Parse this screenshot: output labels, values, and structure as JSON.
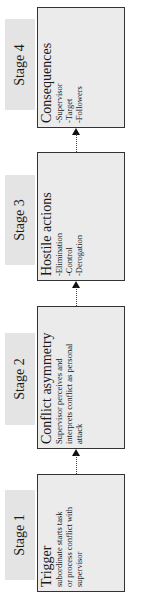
{
  "stages": [
    {
      "label": "Stage 4"
    },
    {
      "label": "Stage 3"
    },
    {
      "label": "Stage 2"
    },
    {
      "label": "Stage 1"
    }
  ],
  "boxes": [
    {
      "title": "Consequences",
      "lines": [
        "-Supervisor",
        "-Target",
        "-Followers"
      ]
    },
    {
      "title": "Hostile actions",
      "lines": [
        "-Elimination",
        "-Control",
        "-Derogation"
      ]
    },
    {
      "title": "Conflict asymmetry",
      "lines": [
        "Supervisor perceives and",
        "interprets conflict as personal",
        "attack"
      ]
    },
    {
      "title": "Trigger",
      "lines": [
        "subordinate starts task",
        "or process conflict with",
        "supervisor"
      ]
    }
  ],
  "colors": {
    "label_bg": "#e4e4e4",
    "box_bg": "#ebebeb",
    "border": "#333333"
  }
}
